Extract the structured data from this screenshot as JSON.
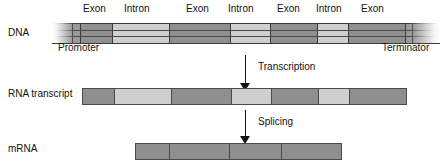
{
  "diagram": {
    "colors": {
      "exon": "#8f8f8f",
      "intron": "#cfcfcf",
      "promoter": "#9a9a9a",
      "terminator": "#9a9a9a",
      "outline": "#4a4a4a",
      "text": "#111111",
      "background": "#ffffff"
    },
    "rows": [
      {
        "id": "dna",
        "label": "DNA",
        "segments": [
          {
            "kind": "flank",
            "label": "",
            "x": 52,
            "w": 20
          },
          {
            "kind": "promoter",
            "label": "Promoter",
            "x": 72,
            "w": 8
          },
          {
            "kind": "exon",
            "label": "Exon",
            "x": 80,
            "w": 32
          },
          {
            "kind": "intron",
            "label": "Intron",
            "x": 112,
            "w": 57
          },
          {
            "kind": "exon",
            "label": "Exon",
            "x": 169,
            "w": 61
          },
          {
            "kind": "intron",
            "label": "Intron",
            "x": 230,
            "w": 40
          },
          {
            "kind": "exon",
            "label": "Exon",
            "x": 270,
            "w": 47
          },
          {
            "kind": "intron",
            "label": "Intron",
            "x": 317,
            "w": 31
          },
          {
            "kind": "exon",
            "label": "Exon",
            "x": 348,
            "w": 57
          },
          {
            "kind": "terminator",
            "label": "Terminator",
            "x": 405,
            "w": 7
          },
          {
            "kind": "flank",
            "label": "",
            "x": 412,
            "w": 28
          }
        ]
      },
      {
        "id": "rna_transcript",
        "label": "RNA transcript",
        "segments": [
          {
            "kind": "exon",
            "label": "Exon",
            "x": 82,
            "w": 31
          },
          {
            "kind": "intron",
            "label": "Intron",
            "x": 113,
            "w": 57
          },
          {
            "kind": "exon",
            "label": "Exon",
            "x": 170,
            "w": 60
          },
          {
            "kind": "intron",
            "label": "Intron",
            "x": 230,
            "w": 40
          },
          {
            "kind": "exon",
            "label": "Exon",
            "x": 270,
            "w": 47
          },
          {
            "kind": "intron",
            "label": "Intron",
            "x": 317,
            "w": 31
          },
          {
            "kind": "exon",
            "label": "Exon",
            "x": 348,
            "w": 57
          }
        ]
      },
      {
        "id": "mrna",
        "label": "mRNA",
        "segments": [
          {
            "kind": "exon",
            "label": "Exon",
            "x": 135,
            "w": 33
          },
          {
            "kind": "exon",
            "label": "Exon",
            "x": 168,
            "w": 60
          },
          {
            "kind": "exon",
            "label": "Exon",
            "x": 228,
            "w": 52
          },
          {
            "kind": "exon",
            "label": "Exon",
            "x": 280,
            "w": 60
          }
        ]
      }
    ],
    "top_labels": [
      {
        "text": "Exon",
        "x": 83,
        "y": 3
      },
      {
        "text": "Intron",
        "x": 124,
        "y": 3
      },
      {
        "text": "Exon",
        "x": 186,
        "y": 3
      },
      {
        "text": "Intron",
        "x": 228,
        "y": 3
      },
      {
        "text": "Exon",
        "x": 277,
        "y": 3
      },
      {
        "text": "Intron",
        "x": 316,
        "y": 3
      },
      {
        "text": "Exon",
        "x": 361,
        "y": 3
      }
    ],
    "bottom_labels": [
      {
        "text": "Promoter",
        "x": 58,
        "y": 42
      },
      {
        "text": "Terminator",
        "x": 382,
        "y": 42
      }
    ],
    "arrows": [
      {
        "id": "transcription",
        "label": "Transcription",
        "x": 245,
        "y": 55,
        "length": 28,
        "label_x": 258,
        "label_y": 61
      },
      {
        "id": "splicing",
        "label": "Splicing",
        "x": 245,
        "y": 110,
        "length": 26,
        "label_x": 258,
        "label_y": 116
      }
    ],
    "row_label_positions": [
      {
        "x": 8,
        "y": 27
      },
      {
        "x": 8,
        "y": 88
      },
      {
        "x": 8,
        "y": 143
      }
    ]
  }
}
